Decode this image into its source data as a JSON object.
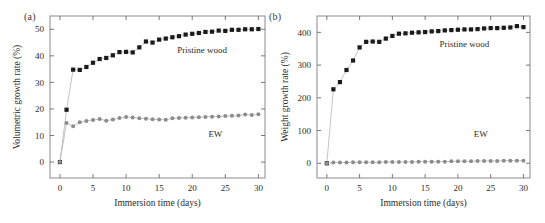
{
  "figure": {
    "panels": [
      {
        "label": "(a)",
        "xlabel": "Immersion time (days)",
        "ylabel": "Volumetric growth rate (%)"
      },
      {
        "label": "(b)",
        "xlabel": "Immersion time (days)",
        "ylabel": "Weight growth rate (%)"
      }
    ]
  },
  "chart_data": [
    {
      "type": "scatter",
      "panel": "(a)",
      "title": "",
      "xlabel": "Immersion time (days)",
      "ylabel": "Volumetric growth rate (%)",
      "xlim": [
        -1.5,
        31
      ],
      "ylim": [
        -6,
        55
      ],
      "xticks": [
        0,
        5,
        10,
        15,
        20,
        25,
        30
      ],
      "xticklabels": [
        "0",
        "5",
        "10",
        "15",
        "20",
        "25",
        "30"
      ],
      "yticks": [
        0,
        10,
        20,
        30,
        40,
        50
      ],
      "yticklabels": [
        "0",
        "10",
        "20",
        "30",
        "40",
        "50"
      ],
      "grid": false,
      "legend": "inline-annotations",
      "annotations": [
        {
          "text": "Pristine wood",
          "x": 21.5,
          "y": 41.0
        },
        {
          "text": "EW",
          "x": 23.5,
          "y": 9.5
        }
      ],
      "series": [
        {
          "name": "Pristine wood",
          "marker": "filled-square",
          "color": "#1a1a1a",
          "x": [
            0,
            1,
            2,
            3,
            4,
            5,
            6,
            7,
            8,
            9,
            10,
            11,
            12,
            13,
            14,
            15,
            16,
            17,
            18,
            19,
            20,
            21,
            22,
            23,
            24,
            25,
            26,
            27,
            28,
            29,
            30
          ],
          "values": [
            0.0,
            19.7,
            34.8,
            34.7,
            35.8,
            37.4,
            38.8,
            39.2,
            40.2,
            41.4,
            41.5,
            41.3,
            43.2,
            45.4,
            45.0,
            46.1,
            46.5,
            47.0,
            47.4,
            48.0,
            48.3,
            48.6,
            49.0,
            49.1,
            49.5,
            49.4,
            49.8,
            49.8,
            50.0,
            50.0,
            50.1
          ]
        },
        {
          "name": "EW",
          "marker": "filled-circle",
          "color": "#8c8c8c",
          "x": [
            0,
            1,
            2,
            3,
            4,
            5,
            6,
            7,
            8,
            9,
            10,
            11,
            12,
            13,
            14,
            15,
            16,
            17,
            18,
            19,
            20,
            21,
            22,
            23,
            24,
            25,
            26,
            27,
            28,
            29,
            30
          ],
          "values": [
            0.0,
            14.7,
            13.5,
            15.0,
            15.5,
            15.8,
            16.2,
            15.6,
            16.0,
            16.6,
            17.0,
            16.8,
            16.5,
            16.3,
            16.1,
            16.0,
            15.9,
            16.5,
            16.6,
            16.7,
            16.8,
            16.9,
            17.0,
            17.1,
            17.2,
            17.3,
            17.4,
            17.5,
            17.9,
            17.7,
            18.0
          ]
        }
      ]
    },
    {
      "type": "scatter",
      "panel": "(b)",
      "title": "",
      "xlabel": "Immersion time (days)",
      "ylabel": "Weight growth rate (%)",
      "xlim": [
        -1.5,
        31
      ],
      "ylim": [
        -45,
        450
      ],
      "xticks": [
        0,
        5,
        10,
        15,
        20,
        25,
        30
      ],
      "xticklabels": [
        "0",
        "5",
        "10",
        "15",
        "20",
        "25",
        "30"
      ],
      "yticks": [
        0,
        100,
        200,
        300,
        400
      ],
      "yticklabels": [
        "0",
        "100",
        "200",
        "300",
        "400"
      ],
      "grid": false,
      "legend": "inline-annotations",
      "annotations": [
        {
          "text": "Pristine wood",
          "x": 21.0,
          "y": 355.0
        },
        {
          "text": "EW",
          "x": 23.5,
          "y": 80.0
        }
      ],
      "series": [
        {
          "name": "Pristine wood",
          "marker": "filled-square",
          "color": "#1a1a1a",
          "x": [
            0,
            1,
            2,
            3,
            4,
            5,
            6,
            7,
            8,
            9,
            10,
            11,
            12,
            13,
            14,
            15,
            16,
            17,
            18,
            19,
            20,
            21,
            22,
            23,
            24,
            25,
            26,
            27,
            28,
            29,
            30
          ],
          "values": [
            0,
            226,
            248,
            285,
            314,
            354,
            371,
            372,
            371,
            381,
            389,
            396,
            397,
            399,
            400,
            401,
            403,
            404,
            406,
            407,
            408,
            409,
            409,
            410,
            412,
            413,
            413,
            414,
            415,
            419,
            416
          ]
        },
        {
          "name": "EW",
          "marker": "filled-circle",
          "color": "#8c8c8c",
          "x": [
            0,
            1,
            2,
            3,
            4,
            5,
            6,
            7,
            8,
            9,
            10,
            11,
            12,
            13,
            14,
            15,
            16,
            17,
            18,
            19,
            20,
            21,
            22,
            23,
            24,
            25,
            26,
            27,
            28,
            29,
            30
          ],
          "values": [
            0,
            2,
            2,
            2,
            3,
            3,
            3,
            3,
            3,
            4,
            4,
            4,
            4,
            4,
            5,
            5,
            5,
            5,
            5,
            6,
            6,
            6,
            6,
            7,
            7,
            7,
            7,
            8,
            8,
            8,
            8
          ]
        }
      ]
    }
  ]
}
